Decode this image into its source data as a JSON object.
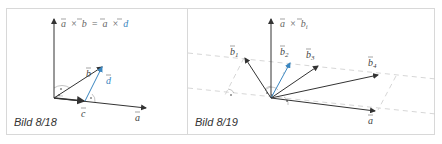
{
  "figures": [
    {
      "id": "left",
      "caption": "Bild 8/18",
      "equation": {
        "lhs_a": "a",
        "op1": "×",
        "lhs_b": "b",
        "equals": "=",
        "rhs_a": "a",
        "op2": "×",
        "rhs_d": "d"
      },
      "vectors": [
        {
          "name": "a",
          "label": "a"
        },
        {
          "name": "b",
          "label": "b"
        },
        {
          "name": "c",
          "label": "c"
        },
        {
          "name": "d",
          "label": "d",
          "color": "#3a86c0"
        }
      ]
    },
    {
      "id": "right",
      "caption": "Bild 8/19",
      "equation": {
        "lhs_a": "a",
        "op": "×",
        "lhs_b": "b",
        "sub": "i"
      },
      "vectors": [
        {
          "name": "a",
          "label": "a"
        },
        {
          "name": "b1",
          "label": "b",
          "sub": "1"
        },
        {
          "name": "b2",
          "label": "b",
          "sub": "2",
          "color": "#3a86c0"
        },
        {
          "name": "b3",
          "label": "b",
          "sub": "3"
        },
        {
          "name": "b4",
          "label": "b",
          "sub": "4"
        }
      ]
    }
  ],
  "colors": {
    "line": "#333333",
    "accent": "#3a86c0",
    "dashed": "#cccccc",
    "frame": "#d8d8d8"
  }
}
